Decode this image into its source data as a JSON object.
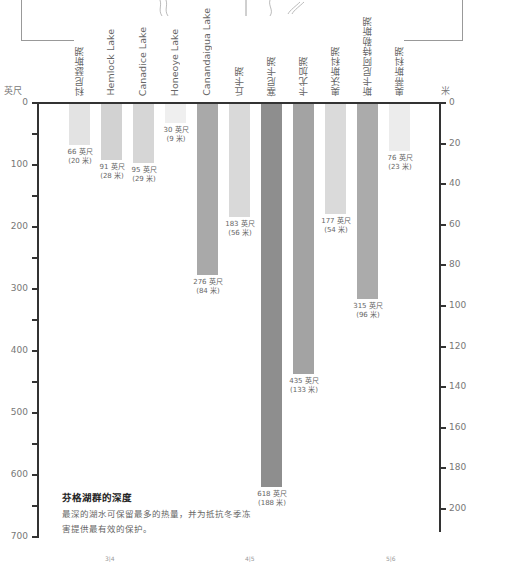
{
  "chart_data": {
    "type": "bar",
    "orientation": "vertical-down",
    "title": "芬格湖群的深度",
    "description": "最深的湖水可保留最多的热量，并为抵抗冬季冻害提供最有效的保护。",
    "categories": [
      "科尼瑟斯湖",
      "Hemlock Lake",
      "Canadice Lake",
      "Honeoye Lake",
      "Canandaigua Lake",
      "丘卡湖",
      "塞尼卡湖",
      "卡尤加湖",
      "奥沃斯科湖",
      "斯卡尼阿特勒斯湖",
      "奥蒂斯科湖"
    ],
    "series": [
      {
        "name": "深度（英尺）",
        "values": [
          66,
          91,
          95,
          30,
          276,
          183,
          618,
          435,
          177,
          315,
          76
        ]
      },
      {
        "name": "深度（米）",
        "values": [
          20,
          28,
          29,
          9,
          84,
          56,
          188,
          133,
          54,
          96,
          23
        ]
      }
    ],
    "value_labels": [
      {
        "ft": "66 英尺",
        "m": "(20 米)"
      },
      {
        "ft": "91 英尺",
        "m": "(28 米)"
      },
      {
        "ft": "95 英尺",
        "m": "(29 米)"
      },
      {
        "ft": "30 英尺",
        "m": "(9 米)"
      },
      {
        "ft": "276 英尺",
        "m": "(84 米)"
      },
      {
        "ft": "183 英尺",
        "m": "(56 米)"
      },
      {
        "ft": "618 英尺",
        "m": "(188 米)"
      },
      {
        "ft": "435 英尺",
        "m": "(133 米)"
      },
      {
        "ft": "177 英尺",
        "m": "(54 米)"
      },
      {
        "ft": "315 英尺",
        "m": "(96 米)"
      },
      {
        "ft": "76 英尺",
        "m": "(23 米)"
      }
    ],
    "left_axis": {
      "label": "英尺",
      "ticks": [
        "0",
        "100",
        "200",
        "300",
        "400",
        "500",
        "600",
        "700"
      ],
      "range": [
        0,
        700
      ]
    },
    "right_axis": {
      "label": "米",
      "ticks": [
        "0",
        "20",
        "40",
        "60",
        "80",
        "100",
        "120",
        "140",
        "160",
        "180",
        "200"
      ],
      "range": [
        0,
        213
      ]
    },
    "bar_colors": [
      "#e3e3e3",
      "#d2d2d2",
      "#d6d6d6",
      "#efefef",
      "#a9a9a9",
      "#d9d9d9",
      "#8e8e8e",
      "#a3a3a3",
      "#dadada",
      "#ababab",
      "#ececec"
    ]
  },
  "page_numbers": [
    "3|4",
    "4|5",
    "5|6"
  ]
}
